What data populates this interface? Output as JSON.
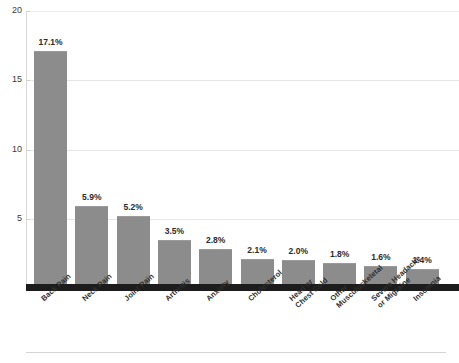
{
  "chart_data": {
    "type": "bar",
    "title": "",
    "xlabel": "",
    "ylabel": "",
    "ylim": [
      0,
      20
    ],
    "yticks": [
      20,
      15,
      10,
      5
    ],
    "grid": true,
    "legend": false,
    "bar_color": "#8c8c8c",
    "baseline_color": "#1c1c1c",
    "categories": [
      "Back Pain",
      "Neck Pain",
      "Joint Pain",
      "Arthritis",
      "Anxiety",
      "Cholesterol",
      "Head or\nChest Cold",
      "Other\nMusculoskeletal",
      "Severe Headache\nor Migraine",
      "Insomnia"
    ],
    "values": [
      17.1,
      5.9,
      5.2,
      3.5,
      2.8,
      2.1,
      2.0,
      1.8,
      1.6,
      1.4
    ],
    "data_labels": [
      "17.1%",
      "5.9%",
      "5.2%",
      "3.5%",
      "2.8%",
      "2.1%",
      "2.0%",
      "1.8%",
      "1.6%",
      "1.4%"
    ]
  },
  "axis": {
    "y_tick_labels": [
      "20",
      "15",
      "10",
      "5"
    ]
  },
  "title_remnant": ""
}
